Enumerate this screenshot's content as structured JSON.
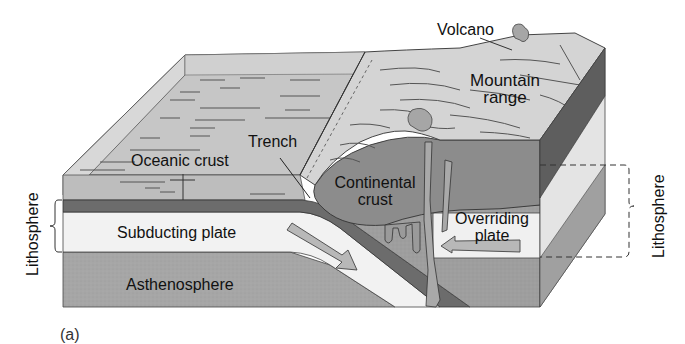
{
  "figure": {
    "panel_label": "(a)",
    "colors": {
      "ocean_surface": "#c9c9c9",
      "ocean_water_front": "#bdbdbd",
      "oceanic_crust": "#6e6e6e",
      "lithosphere": "#f1f1f1",
      "asthenosphere": "#a8a8a8",
      "continental_crust": "#8e8e8e",
      "mountain": "#d6d6d6",
      "outline": "#333333"
    }
  },
  "labels": {
    "volcano": "Volcano",
    "mountain_range_line1": "Mountain",
    "mountain_range_line2": "range",
    "trench": "Trench",
    "oceanic_crust": "Oceanic crust",
    "continental_crust_line1": "Continental",
    "continental_crust_line2": "crust",
    "subducting_plate": "Subducting plate",
    "overriding_plate_line1": "Overriding",
    "overriding_plate_line2": "plate",
    "asthenosphere": "Asthenosphere",
    "lithosphere_left": "Lithosphere",
    "lithosphere_right": "Lithosphere"
  }
}
